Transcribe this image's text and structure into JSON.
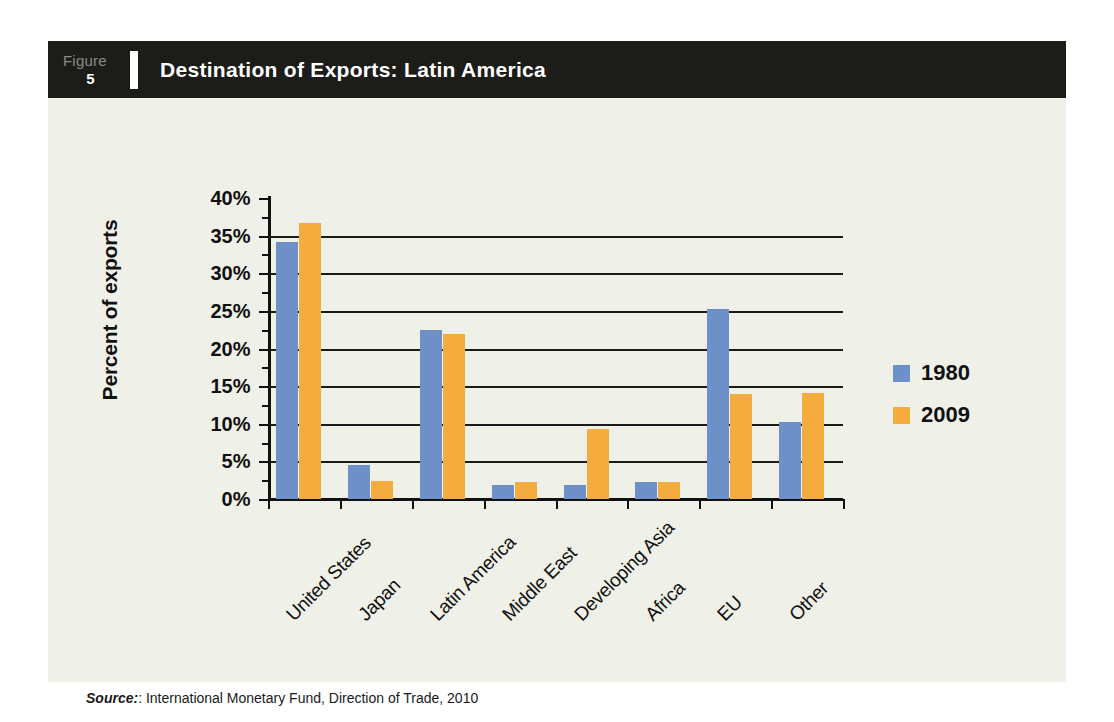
{
  "figure": {
    "label_word": "Figure",
    "number": "5",
    "title": "Destination of Exports: Latin America"
  },
  "source": {
    "prefix": "Source:",
    "text": ": International Monetary Fund, Direction of Trade, 2010"
  },
  "colors": {
    "series_1980": "#6d90c8",
    "series_2009": "#f5ac3e",
    "panel_background": "#eff0e7",
    "header_background": "#1c1c19",
    "axis": "#111111"
  },
  "chart_data": {
    "type": "bar",
    "title": "Destination of Exports: Latin America",
    "xlabel": "",
    "ylabel": "Percent of exports",
    "ylim": [
      0,
      40
    ],
    "ytick_labels": [
      "0%",
      "5%",
      "10%",
      "15%",
      "20%",
      "25%",
      "30%",
      "35%",
      "40%"
    ],
    "ytick_values": [
      0,
      5,
      10,
      15,
      20,
      25,
      30,
      35,
      40
    ],
    "grid": true,
    "legend_position": "right",
    "categories": [
      "United States",
      "Japan",
      "Latin America",
      "Middle East",
      "Developing Asia",
      "Africa",
      "EU",
      "Other"
    ],
    "series": [
      {
        "name": "1980",
        "color": "#6d90c8",
        "values": [
          34.2,
          4.5,
          22.4,
          1.9,
          1.9,
          2.3,
          25.3,
          10.2
        ]
      },
      {
        "name": "2009",
        "color": "#f5ac3e",
        "values": [
          36.7,
          2.4,
          21.9,
          2.2,
          9.3,
          2.3,
          13.9,
          14.1
        ]
      }
    ]
  }
}
